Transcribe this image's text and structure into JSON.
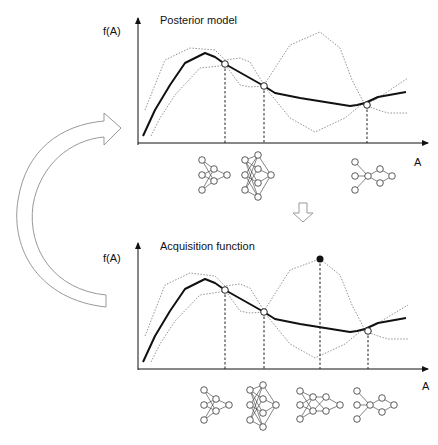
{
  "diagram": {
    "top_panel": {
      "title": "Posterior model",
      "y_label": "f(A)",
      "x_label": "A",
      "observed_points": 3,
      "architectures": 3
    },
    "bottom_panel": {
      "title": "Acquisition function",
      "y_label": "f(A)",
      "x_label": "A",
      "observed_points": 3,
      "selected_point": "filled-circle",
      "architectures": 4
    },
    "arrows": {
      "feedback": "curved-arrow",
      "next_step": "down-arrow"
    }
  }
}
